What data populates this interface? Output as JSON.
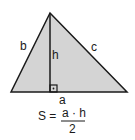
{
  "diagram": {
    "colors": {
      "fill": "#d4d4d4",
      "stroke": "#1a1a1a",
      "background": "#ffffff"
    },
    "labels": {
      "side_b": "b",
      "side_c": "c",
      "base_a": "a",
      "height_h": "h"
    },
    "formula": {
      "lhs": "S =",
      "numerator": "a · h",
      "denominator": "2"
    }
  }
}
